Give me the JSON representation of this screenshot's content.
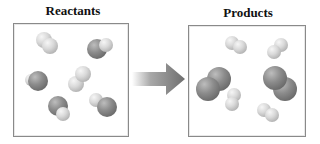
{
  "diagram": {
    "type": "chemical-reaction-particle-diagram",
    "reactants": {
      "title": "Reactants",
      "molecules": [
        {
          "kind": "light-light",
          "atoms": [
            {
              "c": "light",
              "x": 44,
              "y": 40,
              "r": 8
            },
            {
              "c": "light",
              "x": 50,
              "y": 46,
              "r": 8
            }
          ]
        },
        {
          "kind": "dark-light",
          "atoms": [
            {
              "c": "dark",
              "x": 97,
              "y": 49,
              "r": 10
            },
            {
              "c": "light",
              "x": 106,
              "y": 45,
              "r": 7
            }
          ]
        },
        {
          "kind": "dark-light",
          "atoms": [
            {
              "c": "light",
              "x": 31,
              "y": 80,
              "r": 6
            },
            {
              "c": "dark",
              "x": 38,
              "y": 81,
              "r": 10
            }
          ]
        },
        {
          "kind": "light-light",
          "atoms": [
            {
              "c": "light",
              "x": 76,
              "y": 84,
              "r": 8
            },
            {
              "c": "light",
              "x": 83,
              "y": 74,
              "r": 8
            }
          ]
        },
        {
          "kind": "dark-light",
          "atoms": [
            {
              "c": "dark",
              "x": 58,
              "y": 106,
              "r": 10
            },
            {
              "c": "light",
              "x": 63,
              "y": 114,
              "r": 7
            }
          ]
        },
        {
          "kind": "dark-light",
          "atoms": [
            {
              "c": "light",
              "x": 96,
              "y": 100,
              "r": 7
            },
            {
              "c": "dark",
              "x": 107,
              "y": 107,
              "r": 10
            }
          ]
        }
      ]
    },
    "arrow": {
      "direction": "right",
      "color": "#7a7a7a"
    },
    "products": {
      "title": "Products",
      "molecules": [
        {
          "kind": "light-light",
          "atoms": [
            {
              "c": "light",
              "x": 232,
              "y": 43,
              "r": 7
            },
            {
              "c": "light",
              "x": 240,
              "y": 47,
              "r": 7
            }
          ]
        },
        {
          "kind": "light-light",
          "atoms": [
            {
              "c": "light",
              "x": 281,
              "y": 45,
              "r": 7
            },
            {
              "c": "light",
              "x": 274,
              "y": 52,
              "r": 7
            }
          ]
        },
        {
          "kind": "dark-dark",
          "atoms": [
            {
              "c": "dark",
              "x": 219,
              "y": 79,
              "r": 12
            },
            {
              "c": "dark",
              "x": 208,
              "y": 89,
              "r": 12
            }
          ]
        },
        {
          "kind": "dark-dark",
          "atoms": [
            {
              "c": "dark",
              "x": 285,
              "y": 89,
              "r": 12
            },
            {
              "c": "dark",
              "x": 275,
              "y": 78,
              "r": 12
            }
          ]
        },
        {
          "kind": "light-light",
          "atoms": [
            {
              "c": "light",
              "x": 234,
              "y": 95,
              "r": 7
            },
            {
              "c": "light",
              "x": 232,
              "y": 104,
              "r": 7
            }
          ]
        },
        {
          "kind": "light-light",
          "atoms": [
            {
              "c": "light",
              "x": 264,
              "y": 110,
              "r": 7
            },
            {
              "c": "light",
              "x": 272,
              "y": 115,
              "r": 7
            }
          ]
        }
      ]
    }
  }
}
